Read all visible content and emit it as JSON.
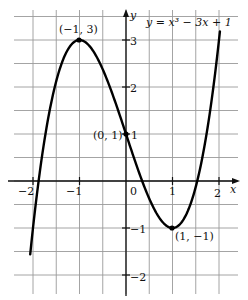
{
  "chart_data": {
    "type": "line",
    "title": "y = x³ − 3x + 1",
    "xlabel": "x",
    "ylabel": "y",
    "xlim": [
      -2.45,
      2.4
    ],
    "ylim": [
      -2.4,
      3.65
    ],
    "grid": true,
    "grid_step": 0.5,
    "x_ticks": [
      -2,
      -1,
      0,
      1,
      2
    ],
    "x_tick_labels": [
      "−2",
      "−1",
      "0",
      "1",
      "2"
    ],
    "y_ticks": [
      -2,
      -1,
      1,
      2,
      3
    ],
    "y_tick_labels": [
      "−2",
      "−1",
      "1",
      "2",
      "3"
    ],
    "series": [
      {
        "name": "y = x³ − 3x + 1",
        "function": "x^3 - 3x + 1",
        "x_range": [
          -2.06,
          2.02
        ],
        "x": [
          -2.06,
          -2,
          -1.75,
          -1.5,
          -1.25,
          -1,
          -0.75,
          -0.5,
          -0.25,
          0,
          0.25,
          0.5,
          0.75,
          1,
          1.25,
          1.5,
          1.75,
          2,
          2.02
        ],
        "y": [
          -1.56,
          -1,
          1.89,
          2.13,
          2.8,
          3,
          2.83,
          2.38,
          1.73,
          1,
          0.27,
          -0.38,
          -0.83,
          -1,
          -0.8,
          -0.13,
          1.11,
          3,
          3.18
        ]
      }
    ],
    "annotations": [
      {
        "text": "(−1, 3)",
        "x": -1,
        "y": 3,
        "point": true
      },
      {
        "text": "(0, 1)",
        "x": 0,
        "y": 1,
        "point": true
      },
      {
        "text": "(1, −1)",
        "x": 1,
        "y": -1,
        "point": true
      }
    ]
  },
  "labels": {
    "equation_lhs": "y",
    "equation_rhs": " = x³ − 3x + 1",
    "x_axis": "x",
    "y_axis": "y",
    "zero": "0",
    "max_point": "(−1, 3)",
    "intercept_point": "(0, 1)",
    "min_point": "(1, −1)",
    "x_m2": "−2",
    "x_m1": "−1",
    "x_1": "1",
    "x_2": "2",
    "y_m2": "−2",
    "y_m1": "−1",
    "y_1": "1",
    "y_2": "2",
    "y_3": "3"
  }
}
